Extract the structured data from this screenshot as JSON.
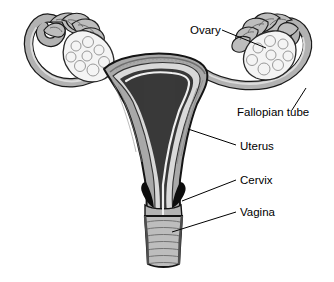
{
  "diagram": {
    "background_color": "#ffffff",
    "labels": [
      {
        "id": "ovary",
        "text": "Ovary",
        "x": 190,
        "y": 34,
        "leader": "M222,30 L266,48"
      },
      {
        "id": "fallopian_tube",
        "text": "Fallopian tube",
        "x": 237,
        "y": 116,
        "leader": "M292,110 L306,88"
      },
      {
        "id": "uterus",
        "text": "Uterus",
        "x": 240,
        "y": 150,
        "leader": "M236,145 L188,129"
      },
      {
        "id": "cervix",
        "text": "Cervix",
        "x": 240,
        "y": 184,
        "leader": "M236,180 L182,201"
      },
      {
        "id": "vagina",
        "text": "Vagina",
        "x": 240,
        "y": 216,
        "leader": "M236,212 L172,232"
      }
    ],
    "parts": [
      {
        "id": "left-fimbriae",
        "name": "Fimbriae (left)"
      },
      {
        "id": "left-ovary",
        "name": "Ovary (left)"
      },
      {
        "id": "left-tube",
        "name": "Fallopian tube (left)"
      },
      {
        "id": "right-fimbriae",
        "name": "Fimbriae (right)"
      },
      {
        "id": "right-ovary",
        "name": "Ovary (right)"
      },
      {
        "id": "right-tube",
        "name": "Fallopian tube (right)"
      },
      {
        "id": "uterus-body",
        "name": "Uterus body / myometrium"
      },
      {
        "id": "uterine-cavity",
        "name": "Uterine cavity / endometrium"
      },
      {
        "id": "cervix-body",
        "name": "Cervix"
      },
      {
        "id": "vaginal-canal",
        "name": "Vagina with rugae"
      }
    ],
    "colors": {
      "outline": "#1a1a1a",
      "muscle_gray": "#a9a9a9",
      "cavity_light": "#d9d9d9",
      "tube_gray": "#b0b0b0",
      "ovary_white": "#f2f2f2",
      "dark_fill": "#111111",
      "label_text": "#000000"
    }
  }
}
